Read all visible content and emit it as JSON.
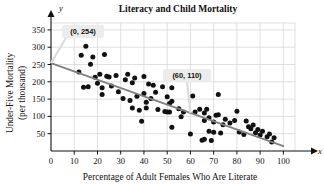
{
  "chart_data": {
    "type": "scatter",
    "title": "Literacy and Child Mortality",
    "xlabel": "Percentage of Adult Females Who Are Literate",
    "ylabel_line1": "Under-Five Mortality",
    "ylabel_line2": "(per thousand)",
    "x_axis_name": "x",
    "y_axis_name": "y",
    "xlim": [
      0,
      105
    ],
    "ylim": [
      0,
      370
    ],
    "xticks": [
      0,
      10,
      20,
      30,
      40,
      50,
      60,
      70,
      80,
      90,
      100
    ],
    "yticks": [
      50,
      100,
      150,
      200,
      250,
      300,
      350
    ],
    "grid": true,
    "legend": "none",
    "point_color": "#111111",
    "line_color": "#808080",
    "grid_color": "#d8d8d8",
    "trendline": {
      "label": "least-squares regression line",
      "x0": 0,
      "y0": 254,
      "x1": 100,
      "y1": 14,
      "points_marked": [
        {
          "x": 0,
          "y": 254,
          "label": "(0, 254)"
        },
        {
          "x": 60,
          "y": 110,
          "label": "(60, 110)"
        }
      ]
    },
    "annotations": [
      {
        "name": "callout-0-254",
        "text": "(0, 254)",
        "x": 0,
        "y": 254
      },
      {
        "name": "callout-60-110",
        "text": "(60, 110)",
        "x": 60,
        "y": 110
      }
    ],
    "points": [
      {
        "x": 12,
        "y": 228
      },
      {
        "x": 13,
        "y": 277
      },
      {
        "x": 14,
        "y": 184
      },
      {
        "x": 15,
        "y": 303
      },
      {
        "x": 16,
        "y": 186
      },
      {
        "x": 17,
        "y": 251
      },
      {
        "x": 18,
        "y": 272
      },
      {
        "x": 19,
        "y": 213
      },
      {
        "x": 20,
        "y": 196
      },
      {
        "x": 21,
        "y": 222
      },
      {
        "x": 22,
        "y": 183
      },
      {
        "x": 22,
        "y": 163
      },
      {
        "x": 23,
        "y": 279
      },
      {
        "x": 24,
        "y": 216
      },
      {
        "x": 25,
        "y": 214
      },
      {
        "x": 26,
        "y": 188
      },
      {
        "x": 28,
        "y": 218
      },
      {
        "x": 29,
        "y": 171
      },
      {
        "x": 31,
        "y": 152
      },
      {
        "x": 32,
        "y": 206
      },
      {
        "x": 33,
        "y": 222
      },
      {
        "x": 34,
        "y": 146
      },
      {
        "x": 35,
        "y": 197
      },
      {
        "x": 35,
        "y": 124
      },
      {
        "x": 36,
        "y": 211
      },
      {
        "x": 37,
        "y": 158
      },
      {
        "x": 38,
        "y": 118
      },
      {
        "x": 39,
        "y": 86
      },
      {
        "x": 40,
        "y": 215
      },
      {
        "x": 40,
        "y": 166
      },
      {
        "x": 41,
        "y": 141
      },
      {
        "x": 41,
        "y": 124
      },
      {
        "x": 42,
        "y": 194
      },
      {
        "x": 43,
        "y": 152
      },
      {
        "x": 44,
        "y": 190
      },
      {
        "x": 45,
        "y": 170
      },
      {
        "x": 46,
        "y": 120
      },
      {
        "x": 48,
        "y": 186
      },
      {
        "x": 49,
        "y": 114
      },
      {
        "x": 50,
        "y": 113
      },
      {
        "x": 50,
        "y": 157
      },
      {
        "x": 51,
        "y": 137
      },
      {
        "x": 51,
        "y": 113
      },
      {
        "x": 52,
        "y": 183
      },
      {
        "x": 52,
        "y": 144
      },
      {
        "x": 52,
        "y": 69
      },
      {
        "x": 55,
        "y": 122
      },
      {
        "x": 56,
        "y": 99
      },
      {
        "x": 57,
        "y": 113
      },
      {
        "x": 60,
        "y": 49
      },
      {
        "x": 61,
        "y": 159
      },
      {
        "x": 62,
        "y": 113
      },
      {
        "x": 64,
        "y": 121
      },
      {
        "x": 65,
        "y": 31
      },
      {
        "x": 66,
        "y": 110
      },
      {
        "x": 66,
        "y": 88
      },
      {
        "x": 66,
        "y": 34
      },
      {
        "x": 67,
        "y": 121
      },
      {
        "x": 68,
        "y": 96
      },
      {
        "x": 68,
        "y": 57
      },
      {
        "x": 69,
        "y": 30
      },
      {
        "x": 70,
        "y": 84
      },
      {
        "x": 70,
        "y": 54
      },
      {
        "x": 71,
        "y": 103
      },
      {
        "x": 72,
        "y": 163
      },
      {
        "x": 72,
        "y": 105
      },
      {
        "x": 73,
        "y": 52
      },
      {
        "x": 74,
        "y": 76
      },
      {
        "x": 75,
        "y": 92
      },
      {
        "x": 77,
        "y": 81
      },
      {
        "x": 79,
        "y": 88
      },
      {
        "x": 80,
        "y": 115
      },
      {
        "x": 81,
        "y": 55
      },
      {
        "x": 83,
        "y": 48
      },
      {
        "x": 84,
        "y": 87
      },
      {
        "x": 85,
        "y": 70
      },
      {
        "x": 86,
        "y": 64
      },
      {
        "x": 87,
        "y": 75
      },
      {
        "x": 88,
        "y": 53
      },
      {
        "x": 89,
        "y": 62
      },
      {
        "x": 90,
        "y": 46
      },
      {
        "x": 91,
        "y": 57
      },
      {
        "x": 93,
        "y": 41
      },
      {
        "x": 94,
        "y": 49
      },
      {
        "x": 95,
        "y": 26
      },
      {
        "x": 96,
        "y": 38
      }
    ]
  }
}
